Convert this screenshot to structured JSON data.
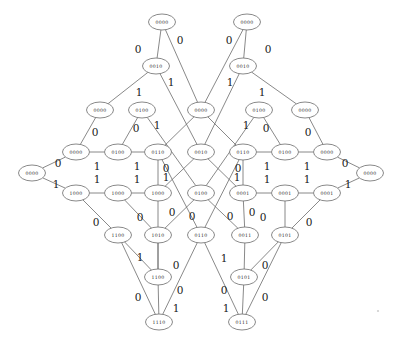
{
  "diagram": {
    "node_label_type": "4-bit binary string",
    "edge_label_type": "binary branch label",
    "colors": {
      "node_stroke": "#6b6b6b",
      "node_fill": "#ffffff",
      "edge_stroke": "#6b6b6b",
      "text": "#2a2a2a"
    },
    "node_radius": {
      "rx": 13.5,
      "ry": 8.0
    },
    "nodes": [
      {
        "id": "n0",
        "label": "0000",
        "x": 162,
        "y": 22
      },
      {
        "id": "n1",
        "label": "0000",
        "x": 247,
        "y": 22
      },
      {
        "id": "n2",
        "label": "0010",
        "x": 156,
        "y": 66
      },
      {
        "id": "n3",
        "label": "0010",
        "x": 243,
        "y": 66
      },
      {
        "id": "n4",
        "label": "0000",
        "x": 100,
        "y": 110
      },
      {
        "id": "n5",
        "label": "0100",
        "x": 142,
        "y": 110
      },
      {
        "id": "n6",
        "label": "0000",
        "x": 201,
        "y": 110
      },
      {
        "id": "n7",
        "label": "0100",
        "x": 259,
        "y": 110
      },
      {
        "id": "n8",
        "label": "0000",
        "x": 305,
        "y": 110
      },
      {
        "id": "n9",
        "label": "0000",
        "x": 76,
        "y": 152
      },
      {
        "id": "n10",
        "label": "0100",
        "x": 118,
        "y": 152
      },
      {
        "id": "n11",
        "label": "0110",
        "x": 158,
        "y": 152
      },
      {
        "id": "n12",
        "label": "0010",
        "x": 201,
        "y": 152
      },
      {
        "id": "n13",
        "label": "0110",
        "x": 243,
        "y": 152
      },
      {
        "id": "n14",
        "label": "0100",
        "x": 285,
        "y": 152
      },
      {
        "id": "n15",
        "label": "0000",
        "x": 327,
        "y": 152
      },
      {
        "id": "n16",
        "label": "0000",
        "x": 32,
        "y": 173
      },
      {
        "id": "n17",
        "label": "0000",
        "x": 370,
        "y": 173
      },
      {
        "id": "n18",
        "label": "1000",
        "x": 76,
        "y": 193
      },
      {
        "id": "n19",
        "label": "1000",
        "x": 118,
        "y": 193
      },
      {
        "id": "n20",
        "label": "1000",
        "x": 158,
        "y": 193
      },
      {
        "id": "n21",
        "label": "0100",
        "x": 201,
        "y": 193
      },
      {
        "id": "n22",
        "label": "0001",
        "x": 243,
        "y": 193
      },
      {
        "id": "n23",
        "label": "0001",
        "x": 285,
        "y": 193
      },
      {
        "id": "n24",
        "label": "0001",
        "x": 327,
        "y": 193
      },
      {
        "id": "n25",
        "label": "1100",
        "x": 118,
        "y": 235
      },
      {
        "id": "n26",
        "label": "1010",
        "x": 158,
        "y": 235
      },
      {
        "id": "n27",
        "label": "0110",
        "x": 201,
        "y": 235
      },
      {
        "id": "n28",
        "label": "0011",
        "x": 245,
        "y": 235
      },
      {
        "id": "n29",
        "label": "0101",
        "x": 285,
        "y": 235
      },
      {
        "id": "n30",
        "label": "1100",
        "x": 158,
        "y": 277
      },
      {
        "id": "n31",
        "label": "0101",
        "x": 244,
        "y": 277
      },
      {
        "id": "n32",
        "label": "1110",
        "x": 159,
        "y": 322
      },
      {
        "id": "n33",
        "label": "0111",
        "x": 242,
        "y": 322
      }
    ],
    "edges": [
      {
        "from": "n0",
        "to": "n2"
      },
      {
        "from": "n0",
        "to": "n6"
      },
      {
        "from": "n1",
        "to": "n3"
      },
      {
        "from": "n1",
        "to": "n6"
      },
      {
        "from": "n2",
        "to": "n4"
      },
      {
        "from": "n2",
        "to": "n12"
      },
      {
        "from": "n3",
        "to": "n8"
      },
      {
        "from": "n3",
        "to": "n12"
      },
      {
        "from": "n4",
        "to": "n9"
      },
      {
        "from": "n5",
        "to": "n10"
      },
      {
        "from": "n5",
        "to": "n21"
      },
      {
        "from": "n6",
        "to": "n11"
      },
      {
        "from": "n6",
        "to": "n13"
      },
      {
        "from": "n7",
        "to": "n14"
      },
      {
        "from": "n7",
        "to": "n21"
      },
      {
        "from": "n8",
        "to": "n15"
      },
      {
        "from": "n9",
        "to": "n10"
      },
      {
        "from": "n10",
        "to": "n11"
      },
      {
        "from": "n11",
        "to": "n20"
      },
      {
        "from": "n11",
        "to": "n27"
      },
      {
        "from": "n12",
        "to": "n20"
      },
      {
        "from": "n12",
        "to": "n22"
      },
      {
        "from": "n13",
        "to": "n14"
      },
      {
        "from": "n13",
        "to": "n22"
      },
      {
        "from": "n13",
        "to": "n27"
      },
      {
        "from": "n14",
        "to": "n15"
      },
      {
        "from": "n16",
        "to": "n9"
      },
      {
        "from": "n16",
        "to": "n18"
      },
      {
        "from": "n17",
        "to": "n15"
      },
      {
        "from": "n17",
        "to": "n24"
      },
      {
        "from": "n18",
        "to": "n19"
      },
      {
        "from": "n18",
        "to": "n25"
      },
      {
        "from": "n19",
        "to": "n20"
      },
      {
        "from": "n19",
        "to": "n26"
      },
      {
        "from": "n20",
        "to": "n30"
      },
      {
        "from": "n21",
        "to": "n26"
      },
      {
        "from": "n21",
        "to": "n28"
      },
      {
        "from": "n22",
        "to": "n23"
      },
      {
        "from": "n22",
        "to": "n28"
      },
      {
        "from": "n23",
        "to": "n24"
      },
      {
        "from": "n23",
        "to": "n29"
      },
      {
        "from": "n24",
        "to": "n29"
      },
      {
        "from": "n25",
        "to": "n30"
      },
      {
        "from": "n25",
        "to": "n32"
      },
      {
        "from": "n26",
        "to": "n30"
      },
      {
        "from": "n27",
        "to": "n32"
      },
      {
        "from": "n27",
        "to": "n33"
      },
      {
        "from": "n28",
        "to": "n31"
      },
      {
        "from": "n29",
        "to": "n31"
      },
      {
        "from": "n29",
        "to": "n33"
      },
      {
        "from": "n30",
        "to": "n32"
      },
      {
        "from": "n31",
        "to": "n33"
      }
    ],
    "edge_labels": [
      {
        "text": "0",
        "x": 138,
        "y": 49
      },
      {
        "text": "0",
        "x": 180,
        "y": 40
      },
      {
        "text": "0",
        "x": 229,
        "y": 40
      },
      {
        "text": "0",
        "x": 268,
        "y": 49
      },
      {
        "text": "1",
        "x": 139,
        "y": 92
      },
      {
        "text": "1",
        "x": 171,
        "y": 82
      },
      {
        "text": "1",
        "x": 230,
        "y": 82
      },
      {
        "text": "1",
        "x": 262,
        "y": 92
      },
      {
        "text": "0",
        "x": 95,
        "y": 132
      },
      {
        "text": "0",
        "x": 136,
        "y": 128
      },
      {
        "text": "1",
        "x": 157,
        "y": 125
      },
      {
        "text": "1",
        "x": 246,
        "y": 125
      },
      {
        "text": "0",
        "x": 266,
        "y": 128
      },
      {
        "text": "0",
        "x": 308,
        "y": 132
      },
      {
        "text": "0",
        "x": 58,
        "y": 163
      },
      {
        "text": "1",
        "x": 97,
        "y": 166
      },
      {
        "text": "1",
        "x": 137,
        "y": 166
      },
      {
        "text": "0",
        "x": 166,
        "y": 168
      },
      {
        "text": "0",
        "x": 238,
        "y": 168
      },
      {
        "text": "1",
        "x": 267,
        "y": 166
      },
      {
        "text": "1",
        "x": 307,
        "y": 166
      },
      {
        "text": "0",
        "x": 345,
        "y": 163
      },
      {
        "text": "1",
        "x": 56,
        "y": 184
      },
      {
        "text": "1",
        "x": 97,
        "y": 179
      },
      {
        "text": "1",
        "x": 137,
        "y": 179
      },
      {
        "text": "1",
        "x": 166,
        "y": 177
      },
      {
        "text": "1",
        "x": 237,
        "y": 177
      },
      {
        "text": "1",
        "x": 267,
        "y": 179
      },
      {
        "text": "1",
        "x": 307,
        "y": 179
      },
      {
        "text": "1",
        "x": 348,
        "y": 184
      },
      {
        "text": "0",
        "x": 96,
        "y": 222
      },
      {
        "text": "0",
        "x": 140,
        "y": 217
      },
      {
        "text": "0",
        "x": 172,
        "y": 212
      },
      {
        "text": "0",
        "x": 192,
        "y": 216
      },
      {
        "text": "0",
        "x": 230,
        "y": 216
      },
      {
        "text": "0",
        "x": 252,
        "y": 212
      },
      {
        "text": "0",
        "x": 263,
        "y": 217
      },
      {
        "text": "0",
        "x": 309,
        "y": 222
      },
      {
        "text": "1",
        "x": 140,
        "y": 257
      },
      {
        "text": "0",
        "x": 176,
        "y": 265
      },
      {
        "text": "1",
        "x": 224,
        "y": 258
      },
      {
        "text": "0",
        "x": 265,
        "y": 265
      },
      {
        "text": "0",
        "x": 138,
        "y": 297
      },
      {
        "text": "0",
        "x": 180,
        "y": 290
      },
      {
        "text": "0",
        "x": 224,
        "y": 290
      },
      {
        "text": "0",
        "x": 265,
        "y": 297
      },
      {
        "text": "1",
        "x": 176,
        "y": 308
      },
      {
        "text": "1",
        "x": 226,
        "y": 308
      }
    ]
  }
}
